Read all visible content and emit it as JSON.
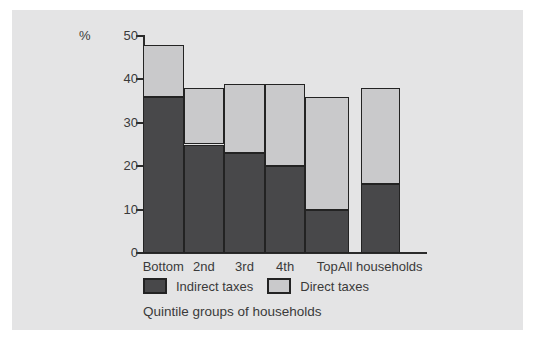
{
  "chart_data": {
    "type": "bar",
    "stacked": true,
    "title": "",
    "categories": [
      "Bottom",
      "2nd",
      "3rd",
      "4th",
      "Top",
      "All households"
    ],
    "series": [
      {
        "name": "Indirect taxes",
        "color": "#48484a",
        "values": [
          36,
          25,
          23,
          20,
          10,
          16
        ]
      },
      {
        "name": "Direct taxes",
        "color": "#c9c9cb",
        "values": [
          12,
          13,
          16,
          19,
          26,
          22
        ]
      }
    ],
    "totals": [
      48,
      38,
      39,
      39,
      36,
      38
    ],
    "ylabel": "%",
    "xlabel": "Quintile groups of households",
    "ylim": [
      0,
      50
    ],
    "yticks": [
      0,
      10,
      20,
      30,
      40,
      50
    ],
    "grid": false,
    "legend_position": "bottom",
    "separated_last_category": true
  },
  "colors": {
    "panel_bg": "#e4e4e5",
    "axis": "#2b2b2b",
    "bar_border": "#232323",
    "text": "#3a3a3a",
    "outer_bg": "#ffffff"
  }
}
